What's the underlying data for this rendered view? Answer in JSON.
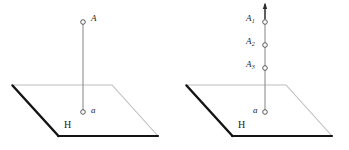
{
  "figure": {
    "background_color": "#ffffff",
    "ink_color": "#1a1a1a",
    "edge_dark_color": "#111111",
    "edge_light_color": "#b9b9b9",
    "line_color": "#8c8c8c",
    "width": 349,
    "height": 150
  },
  "panels": [
    {
      "id": "left",
      "plane": {
        "label": "H",
        "label_x": 64,
        "label_y": 120,
        "corners": [
          {
            "x": 12,
            "y": 85
          },
          {
            "x": 112,
            "y": 85
          },
          {
            "x": 158,
            "y": 136
          },
          {
            "x": 58,
            "y": 136
          }
        ]
      },
      "vertical_line": {
        "x": 83,
        "y_top": 24,
        "y_bottom": 112,
        "has_arrow": false
      },
      "points": [
        {
          "id": "A",
          "label": "A",
          "subscript": "",
          "x": 83,
          "y": 22,
          "label_side": "right",
          "label_x": 92,
          "label_y": 16
        },
        {
          "id": "a",
          "label": "a",
          "subscript": "",
          "x": 83,
          "y": 112,
          "label_side": "right",
          "label_x": 92,
          "label_y": 108
        }
      ]
    },
    {
      "id": "right",
      "plane": {
        "label": "H",
        "label_x": 64,
        "label_y": 120,
        "corners": [
          {
            "x": 12,
            "y": 85
          },
          {
            "x": 112,
            "y": 85
          },
          {
            "x": 158,
            "y": 136
          },
          {
            "x": 58,
            "y": 136
          }
        ]
      },
      "vertical_line": {
        "x": 91,
        "y_top": 6,
        "y_bottom": 112,
        "has_arrow": true
      },
      "points": [
        {
          "id": "A1",
          "label": "A",
          "subscript": "1",
          "x": 91,
          "y": 22,
          "label_side": "left",
          "label_x": 72,
          "label_y": 16
        },
        {
          "id": "A2",
          "label": "A",
          "subscript": "2",
          "x": 91,
          "y": 45,
          "label_side": "left",
          "label_x": 72,
          "label_y": 39
        },
        {
          "id": "A3",
          "label": "A",
          "subscript": "3",
          "x": 91,
          "y": 68,
          "label_side": "left",
          "label_x": 72,
          "label_y": 62
        },
        {
          "id": "a",
          "label": "a",
          "subscript": "",
          "x": 91,
          "y": 112,
          "label_side": "left",
          "label_x": 79,
          "label_y": 108
        }
      ]
    }
  ]
}
